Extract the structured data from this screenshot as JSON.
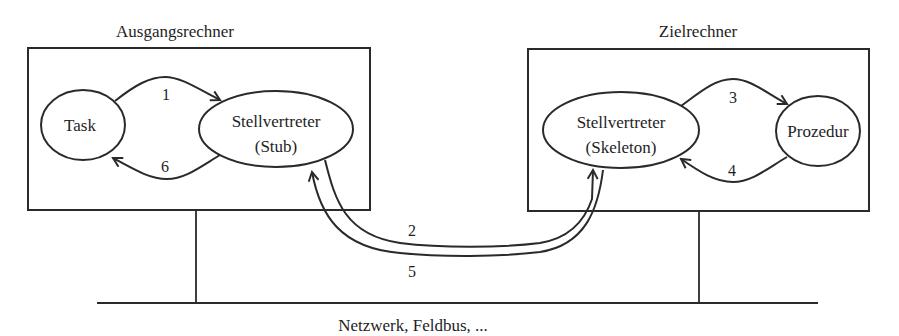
{
  "diagram": {
    "type": "rpc-architecture",
    "source_host": {
      "title": "Ausgangsrechner",
      "nodes": [
        {
          "id": "task",
          "label": "Task"
        },
        {
          "id": "stub",
          "label_line1": "Stellvertreter",
          "label_line2": "(Stub)"
        }
      ]
    },
    "target_host": {
      "title": "Zielrechner",
      "nodes": [
        {
          "id": "skeleton",
          "label_line1": "Stellvertreter",
          "label_line2": "(Skeleton)"
        },
        {
          "id": "procedure",
          "label": "Prozedur"
        }
      ]
    },
    "network": {
      "label": "Netzwerk, Feldbus, ..."
    },
    "edges": [
      {
        "step": "1",
        "from": "task",
        "to": "stub"
      },
      {
        "step": "2",
        "from": "stub",
        "to": "skeleton"
      },
      {
        "step": "3",
        "from": "skeleton",
        "to": "procedure"
      },
      {
        "step": "4",
        "from": "procedure",
        "to": "skeleton"
      },
      {
        "step": "5",
        "from": "skeleton",
        "to": "stub"
      },
      {
        "step": "6",
        "from": "stub",
        "to": "task"
      }
    ],
    "colors": {
      "stroke": "#2a2a2a",
      "text": "#1e1e1e",
      "background": "#ffffff"
    }
  }
}
